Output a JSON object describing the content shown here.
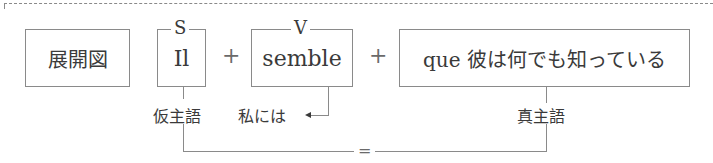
{
  "diagram": {
    "expansion_label": "展開図",
    "subject": {
      "role": "S",
      "text": "Il"
    },
    "verb": {
      "role": "V",
      "text": "semble"
    },
    "clause": {
      "text": "que 彼は何でも知っている"
    },
    "plus_1": "+",
    "plus_2": "+",
    "labels": {
      "provisional_subject": "仮主語",
      "to_me": "私には",
      "true_subject": "真主語",
      "equals": "="
    }
  }
}
